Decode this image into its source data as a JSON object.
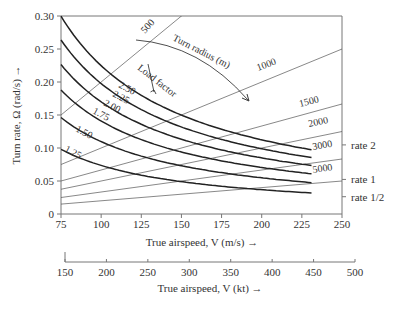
{
  "chart_data": {
    "type": "line",
    "title": "",
    "xlabel": "True airspeed, V (m/s) →",
    "xlabel_secondary": "True airspeed, V (kt) →",
    "ylabel": "Turn rate, Ω (rad/s) →",
    "xlim": [
      75,
      250
    ],
    "ylim": [
      0,
      0.3
    ],
    "x_ticks": [
      75,
      100,
      125,
      150,
      175,
      200,
      225,
      250
    ],
    "y_ticks": [
      0,
      0.05,
      0.1,
      0.15,
      0.2,
      0.25,
      0.3
    ],
    "y_tick_labels": [
      "0",
      "0.05",
      "0.10",
      "0.15",
      "0.20",
      "0.25",
      "0.30"
    ],
    "secondary_x_ticks": [
      150,
      200,
      250,
      300,
      350,
      400,
      450,
      500
    ],
    "grid": false,
    "load_factor_label": "Load factor",
    "turn_radius_label": "Turn radius (m)",
    "load_factor_series": [
      {
        "name": "1.25",
        "n": 1.25,
        "x": [
          75,
          100,
          125,
          150,
          175,
          200,
          231
        ],
        "values": [
          0.098,
          0.074,
          0.059,
          0.049,
          0.042,
          0.037,
          0.032
        ]
      },
      {
        "name": "1.50",
        "n": 1.5,
        "x": [
          75,
          100,
          125,
          150,
          175,
          200,
          231
        ],
        "values": [
          0.146,
          0.11,
          0.088,
          0.073,
          0.063,
          0.055,
          0.047
        ]
      },
      {
        "name": "1.75",
        "n": 1.75,
        "x": [
          75,
          100,
          125,
          150,
          175,
          200,
          231
        ],
        "values": [
          0.188,
          0.141,
          0.113,
          0.094,
          0.081,
          0.07,
          0.061
        ]
      },
      {
        "name": "2.00",
        "n": 2.0,
        "x": [
          75,
          100,
          125,
          150,
          175,
          200,
          231
        ],
        "values": [
          0.227,
          0.17,
          0.136,
          0.113,
          0.097,
          0.085,
          0.074
        ]
      },
      {
        "name": "2.25",
        "n": 2.25,
        "x": [
          75,
          100,
          125,
          150,
          175,
          200,
          231
        ],
        "values": [
          0.264,
          0.198,
          0.158,
          0.132,
          0.113,
          0.099,
          0.086
        ]
      },
      {
        "name": "2.50",
        "n": 2.5,
        "x": [
          75,
          100,
          125,
          150,
          175,
          200,
          231
        ],
        "values": [
          0.3,
          0.225,
          0.18,
          0.15,
          0.128,
          0.112,
          0.097
        ]
      }
    ],
    "turn_radius_series": [
      {
        "name": "500",
        "R": 500,
        "x": [
          75,
          150
        ],
        "values": [
          0.15,
          0.3
        ]
      },
      {
        "name": "1000",
        "R": 1000,
        "x": [
          75,
          250
        ],
        "values": [
          0.075,
          0.25
        ]
      },
      {
        "name": "1500",
        "R": 1500,
        "x": [
          75,
          250
        ],
        "values": [
          0.05,
          0.167
        ]
      },
      {
        "name": "2000",
        "R": 2000,
        "x": [
          75,
          250
        ],
        "values": [
          0.0375,
          0.125
        ]
      },
      {
        "name": "3000",
        "R": 3000,
        "x": [
          75,
          250
        ],
        "values": [
          0.025,
          0.083
        ]
      },
      {
        "name": "5000",
        "R": 5000,
        "x": [
          75,
          250
        ],
        "values": [
          0.015,
          0.05
        ]
      }
    ],
    "reference_ticks": [
      {
        "label": "rate 2",
        "value": 0.1047
      },
      {
        "label": "rate 1",
        "value": 0.0524
      },
      {
        "label": "rate 1/2",
        "value": 0.0262
      }
    ]
  }
}
